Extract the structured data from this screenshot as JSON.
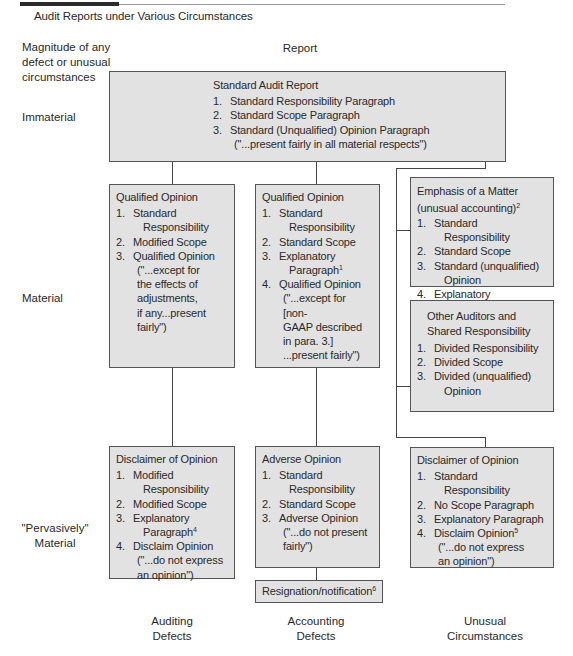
{
  "figure": {
    "title": "Audit Reports under Various Circumstances",
    "left_header": "Magnitude of any defect or unusual circumstances",
    "left_header_lines": [
      "Magnitude of any",
      "defect or unusual",
      "circumstances"
    ],
    "report_header": "Report"
  },
  "rows": {
    "immaterial": "Immaterial",
    "material": "Material",
    "pervasive_line1": "\"Pervasively\"",
    "pervasive_line2": "Material"
  },
  "standard_box": {
    "title": "Standard Audit Report",
    "items": [
      {
        "num": "1.",
        "text": "Standard Responsibility Paragraph"
      },
      {
        "num": "2.",
        "text": "Standard Scope Paragraph"
      },
      {
        "num": "3.",
        "text": "Standard (Unqualified) Opinion Paragraph",
        "quote": "(\"...present fairly in all material respects\")"
      }
    ]
  },
  "qualified_auditing": {
    "title": "Qualified Opinion",
    "items": [
      {
        "num": "1.",
        "line1": "Standard",
        "line2": "Responsibility"
      },
      {
        "num": "2.",
        "line1": "Modified Scope"
      },
      {
        "num": "3.",
        "line1": "Qualified Opinion",
        "quote": [
          "(\"...except for",
          "the effects of",
          "adjustments,",
          "if any...present",
          "fairly\")"
        ]
      }
    ]
  },
  "qualified_accounting": {
    "title": "Qualified Opinion",
    "items": [
      {
        "num": "1.",
        "line1": "Standard",
        "line2": "Responsibility"
      },
      {
        "num": "2.",
        "line1": "Standard Scope"
      },
      {
        "num": "3.",
        "line1": "Explanatory",
        "line2": "Paragraph",
        "sup": "1"
      },
      {
        "num": "4.",
        "line1": "Qualified Opinion",
        "quote": [
          "(\"...except for [non-",
          "GAAP described",
          "in para. 3.]",
          "...present fairly\")"
        ]
      }
    ]
  },
  "emphasis_box": {
    "title": "Emphasis of a Matter",
    "subtitle": "(unusual accounting)",
    "subtitle_sup": "2",
    "items": [
      {
        "num": "1.",
        "line1": "Standard",
        "line2": "Responsibility"
      },
      {
        "num": "2.",
        "line1": "Standard Scope"
      },
      {
        "num": "3.",
        "line1": "Standard (unqualified)",
        "line2": "Opinion"
      },
      {
        "num": "4.",
        "line1": "Explanatory Paragraph",
        "sup": "3"
      }
    ]
  },
  "other_auditors_box": {
    "title_line1": "Other Auditors and",
    "title_line2": "Shared Responsibility",
    "items": [
      {
        "num": "1.",
        "line1": "Divided Responsibility"
      },
      {
        "num": "2.",
        "line1": "Divided Scope"
      },
      {
        "num": "3.",
        "line1": "Divided (unqualified)",
        "line2": "Opinion"
      }
    ]
  },
  "disclaimer_auditing": {
    "title": "Disclaimer of Opinion",
    "items": [
      {
        "num": "1.",
        "line1": "Modified",
        "line2": "Responsibility"
      },
      {
        "num": "2.",
        "line1": "Modified Scope"
      },
      {
        "num": "3.",
        "line1": "Explanatory",
        "line2": "Paragraph",
        "sup": "4"
      },
      {
        "num": "4.",
        "line1": "Disclaim Opinion",
        "quote": [
          "(\"...do not express",
          "an opinion\")"
        ]
      }
    ]
  },
  "adverse_box": {
    "title": "Adverse Opinion",
    "items": [
      {
        "num": "1.",
        "line1": "Standard",
        "line2": "Responsibility"
      },
      {
        "num": "2.",
        "line1": "Standard Scope"
      },
      {
        "num": "3.",
        "line1": "Adverse Opinion",
        "quote": [
          "(\"...do not present",
          "fairly\")"
        ]
      }
    ]
  },
  "resignation_box": {
    "text": "Resignation/notification",
    "sup": "6"
  },
  "disclaimer_unusual": {
    "title": "Disclaimer of Opinion",
    "items": [
      {
        "num": "1.",
        "line1": "Standard",
        "line2": "Responsibility"
      },
      {
        "num": "2.",
        "line1": "No Scope Paragraph"
      },
      {
        "num": "3.",
        "line1": "Explanatory Paragraph"
      },
      {
        "num": "4.",
        "line1": "Disclaim Opinion",
        "sup": "5",
        "quote": [
          "(\"...do not express",
          "an opinion\")"
        ]
      }
    ]
  },
  "columns": [
    {
      "line1": "Auditing",
      "line2": "Defects"
    },
    {
      "line1": "Accounting",
      "line2": "Defects"
    },
    {
      "line1": "Unusual",
      "line2": "Circumstances"
    }
  ]
}
